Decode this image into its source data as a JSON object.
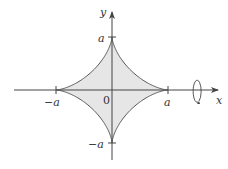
{
  "diagram": {
    "curve": "astroid x^(2/3)+y^(2/3)=a^(2/3)",
    "fill_color": "#e6e6e6",
    "stroke_color": "#555555",
    "labels": {
      "y_axis": "y",
      "x_axis": "x",
      "top": "a",
      "bottom": "−a",
      "left": "−a",
      "right": "a",
      "origin": "0"
    },
    "rotation_indicator": "rotation about x-axis"
  }
}
